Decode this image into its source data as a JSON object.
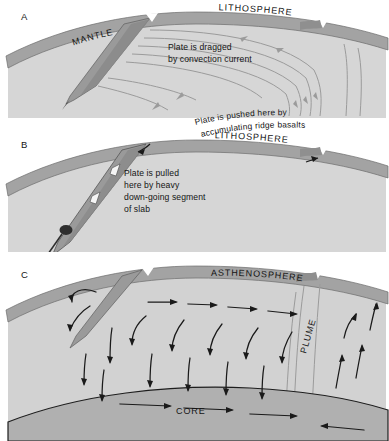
{
  "figure": {
    "type": "geological-cross-section-diagram",
    "panel_count": 3,
    "background_color": "#ffffff"
  },
  "colors": {
    "lithosphere_band": "#a3a3a3",
    "lithosphere_band_dark": "#8f8f8f",
    "mantle_interior": "#d6d6d6",
    "asthenosphere_interior": "#d2d2d2",
    "core_band": "#b0b0b0",
    "slab_dark": "#8a8a8a",
    "slab_darker": "#6f6f6f",
    "flow_line": "#8d8d8d",
    "arrow": "#1a1a1a",
    "text": "#141414",
    "outline": "#555555"
  },
  "panels": [
    {
      "id": "A",
      "letter": "A",
      "mechanism": "mantle-drag",
      "labels": [
        {
          "name": "mantle-label",
          "text": "MANTLE",
          "style": "caps-rotated"
        },
        {
          "name": "lithosphere-label",
          "text": "LITHOSPHERE",
          "style": "caps-rotated"
        }
      ],
      "annotations": [
        {
          "name": "convection-drag-note",
          "line1": "Plate is dragged",
          "line2": "by convection current"
        }
      ],
      "features": [
        "subduction-trench-left",
        "mid-ocean-ridge-right",
        "convection-flow-lines"
      ]
    },
    {
      "id": "B",
      "letter": "B",
      "mechanism": "slab-pull",
      "labels": [
        {
          "name": "lithosphere-label",
          "text": "LITHOSPHERE",
          "style": "caps-rotated"
        }
      ],
      "annotations": [
        {
          "name": "slab-pull-note",
          "line1": "Plate is pulled",
          "line2": "here by heavy",
          "line3": "down-going segment",
          "line4": "of slab"
        },
        {
          "name": "ridge-push-note",
          "line1": "Plate is pushed here by",
          "line2": "accumulating ridge basalts"
        }
      ],
      "features": [
        "deep-subducting-slab",
        "white-arrows-in-slab",
        "dense-slab-tip",
        "mid-ocean-ridge-right"
      ]
    },
    {
      "id": "C",
      "letter": "C",
      "mechanism": "whole-mantle-convection",
      "labels": [
        {
          "name": "asthenosphere-label",
          "text": "ASTHENOSPHERE",
          "style": "caps-rotated"
        },
        {
          "name": "plume-label",
          "text": "PLUME",
          "style": "caps-vertical"
        },
        {
          "name": "core-label",
          "text": "CORE",
          "style": "caps"
        }
      ],
      "annotations": [],
      "features": [
        "convection-cell-arrows",
        "mantle-plume-column",
        "core-boundary-arc",
        "subduction-trench-left",
        "mid-ocean-ridge-right"
      ]
    }
  ]
}
